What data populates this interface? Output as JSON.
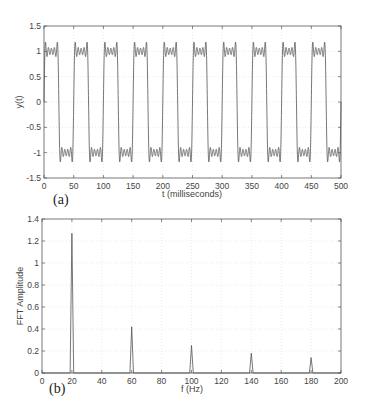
{
  "chart_data": [
    {
      "type": "line",
      "panel_label": "(a)",
      "title": "",
      "xlabel": "t (milliseconds)",
      "ylabel": "y(t)",
      "xlim": [
        0,
        500
      ],
      "ylim": [
        -1.5,
        1.5
      ],
      "xticks": [
        0,
        50,
        100,
        150,
        200,
        250,
        300,
        350,
        400,
        450,
        500
      ],
      "yticks": [
        -1.5,
        -1,
        -0.5,
        0,
        0.5,
        1,
        1.5
      ],
      "grid": true,
      "description": "Fourier-series approximation of a 20 Hz square wave (harmonics 1,3,5,7,9) with Gibbs ripple, amplitude ±1, period 50 ms",
      "series": [
        {
          "name": "y(t)",
          "fundamental_hz": 20,
          "period_ms": 50,
          "harmonics": [
            1,
            3,
            5,
            7,
            9
          ],
          "amplitude": 1,
          "overshoot": 1.18
        }
      ]
    },
    {
      "type": "line",
      "panel_label": "(b)",
      "title": "",
      "xlabel": "f (Hz)",
      "ylabel": "FFT Amplitude",
      "xlim": [
        0,
        200
      ],
      "ylim": [
        0,
        1.4
      ],
      "xticks": [
        0,
        20,
        40,
        60,
        80,
        100,
        120,
        140,
        160,
        180,
        200
      ],
      "yticks": [
        0,
        0.2,
        0.4,
        0.6,
        0.8,
        1,
        1.2,
        1.4
      ],
      "grid": true,
      "x": [
        20,
        60,
        100,
        140,
        180
      ],
      "values": [
        1.27,
        0.42,
        0.25,
        0.18,
        0.14
      ]
    }
  ],
  "labels": {
    "a": {
      "panel": "(a)",
      "xlabel": "t (milliseconds)",
      "ylabel": "y(t)",
      "xticks": [
        "0",
        "50",
        "100",
        "150",
        "200",
        "250",
        "300",
        "350",
        "400",
        "450",
        "500"
      ],
      "yticks": [
        "-1.5",
        "-1",
        "-0.5",
        "0",
        "0.5",
        "1",
        "1.5"
      ]
    },
    "b": {
      "panel": "(b)",
      "xlabel": "f (Hz)",
      "ylabel": "FFT Amplitude",
      "xticks": [
        "0",
        "20",
        "40",
        "60",
        "80",
        "100",
        "120",
        "140",
        "160",
        "180",
        "200"
      ],
      "yticks": [
        "0",
        "0.2",
        "0.4",
        "0.6",
        "0.8",
        "1",
        "1.2",
        "1.4"
      ]
    }
  },
  "colors": {
    "line": "#555555",
    "axis": "#555555",
    "grid": "#dddddd"
  }
}
